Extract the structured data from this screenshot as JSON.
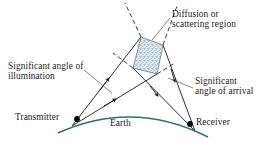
{
  "figure": {
    "background_color": "#ffffff"
  },
  "labels": {
    "diffusion_line1": "Diffusion or",
    "diffusion_line2": "scattering region",
    "illumination_line1": "Significant angle of",
    "illumination_line2": "illumination",
    "arrival_line1": "Significant",
    "arrival_line2": "angle of arrival",
    "transmitter": "Transmitter",
    "receiver": "Receiver",
    "earth": "Earth"
  },
  "colors": {
    "ink": "#1a1a1a",
    "ray": "#262626",
    "earth_arc": "#2f6f74",
    "scatter_fill": "#dfe9ee",
    "scatter_speckle": "#5f8fa6",
    "scatter_outline": "#3d3d3d",
    "dashed": "#262626",
    "node": "#000000"
  },
  "geometry": {
    "transmitter_point": [
      77,
      119
    ],
    "receiver_point": [
      190,
      124
    ],
    "scatter_region_vertices": [
      [
        133,
        68
      ],
      [
        141,
        37
      ],
      [
        163,
        45
      ],
      [
        157,
        74
      ]
    ],
    "earth_arc": {
      "start": [
        58,
        133
      ],
      "control": [
        133,
        99
      ],
      "end": [
        208,
        137
      ]
    }
  },
  "icons": {
    "transmitter_node": "filled-dot",
    "receiver_node": "filled-dot",
    "ray_arrow": "arrowhead"
  }
}
